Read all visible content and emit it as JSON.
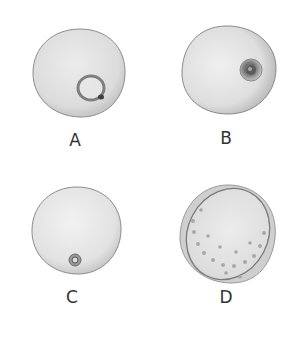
{
  "figure": {
    "panels": [
      {
        "id": "A",
        "label": "A",
        "description": "round cell with large ring-shaped nucleus at lower right, dark spot on ring"
      },
      {
        "id": "B",
        "label": "B",
        "description": "round cell with small dark concentric nucleus at right edge"
      },
      {
        "id": "C",
        "label": "C",
        "description": "round cell with tiny concentric nucleus near bottom"
      },
      {
        "id": "D",
        "label": "D",
        "description": "cell with tilted elliptical rim and ring of small dots"
      }
    ],
    "colors": {
      "background": "#ffffff",
      "cell_fill": "#e4e4e4",
      "cell_outline": "#8a8a8a",
      "nucleus_dark": "#5a5a5a",
      "label": "#333333"
    }
  }
}
